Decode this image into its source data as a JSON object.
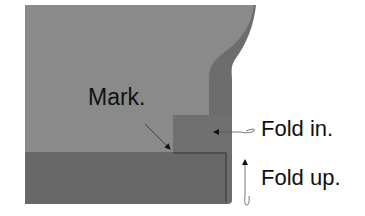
{
  "diagram": {
    "labels": {
      "mark": "Mark.",
      "fold_in": "Fold in.",
      "fold_up": "Fold up."
    },
    "colors": {
      "background": "#ffffff",
      "panel_light": "#8a8a8a",
      "panel_dark": "#6d6d6d",
      "bottom_band": "#686868",
      "step_block": "#707070",
      "outline": "#333333",
      "text": "#111111"
    },
    "parts": [
      {
        "name": "main-panel",
        "description": "light gray fabric panel"
      },
      {
        "name": "curved-edge-strip",
        "description": "darker curved side strip"
      },
      {
        "name": "fold-in-step",
        "description": "stepped flap to fold in"
      },
      {
        "name": "bottom-hem-band",
        "description": "bottom band to fold up"
      }
    ],
    "arrows": [
      {
        "name": "mark-arrow",
        "target": "mark point at step corner"
      },
      {
        "name": "fold-in-arrow",
        "direction": "left"
      },
      {
        "name": "fold-up-arrow",
        "direction": "up"
      }
    ]
  }
}
